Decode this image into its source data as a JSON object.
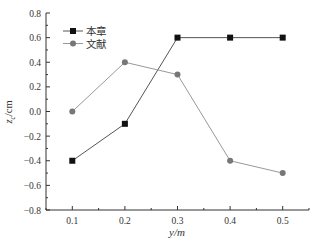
{
  "chart_data": {
    "type": "line",
    "title": "",
    "xlabel": "y/m",
    "ylabel": "z_c/cm",
    "ylabel_main": "z",
    "ylabel_sub": "c",
    "ylabel_unit": "/cm",
    "x": [
      0.1,
      0.2,
      0.3,
      0.4,
      0.5
    ],
    "xlim": [
      0.05,
      0.55
    ],
    "ylim": [
      -0.8,
      0.8
    ],
    "xticks": [
      "0.1",
      "0.2",
      "0.3",
      "0.4",
      "0.5"
    ],
    "yticks": [
      "0.8",
      "0.6",
      "0.4",
      "0.2",
      "0.0",
      "−0.2",
      "−0.4",
      "−0.6",
      "−0.8"
    ],
    "grid": false,
    "legend_position": "upper-left",
    "series": [
      {
        "name": "本章",
        "marker": "square",
        "color": "#111111",
        "line_color": "#555555",
        "values": [
          -0.4,
          -0.1,
          0.6,
          0.6,
          0.6
        ]
      },
      {
        "name": "文献",
        "marker": "circle",
        "color": "#777777",
        "line_color": "#999999",
        "values": [
          0.0,
          0.4,
          0.3,
          -0.4,
          -0.5
        ]
      }
    ]
  }
}
